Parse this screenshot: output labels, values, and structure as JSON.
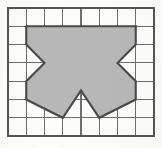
{
  "figure": {
    "background_color": "#fdfdfc"
  },
  "grid": {
    "columns": 8,
    "rows": 7,
    "origin_x": 8,
    "origin_y": 8,
    "cell_width": 18.25,
    "cell_height": 18.3,
    "line_color": "#6e6e6e",
    "border_color": "#555555",
    "line_width": 1.1,
    "border_width": 1.6
  },
  "shape": {
    "name": "shaded-polygon",
    "fill_color": "#b8b8b8",
    "stroke_color": "#4a4a4a",
    "stroke_width": 2.1,
    "fill_opacity": 1,
    "vertices_grid": [
      [
        1,
        1
      ],
      [
        7,
        1
      ],
      [
        7,
        2
      ],
      [
        6,
        3
      ],
      [
        7,
        4
      ],
      [
        7,
        5
      ],
      [
        5,
        6
      ],
      [
        4,
        4.5
      ],
      [
        3,
        6
      ],
      [
        1,
        5
      ],
      [
        1,
        4
      ],
      [
        2,
        3
      ],
      [
        1,
        2
      ]
    ],
    "vertex_count": 13,
    "symmetry": "vertical mirror about column 4"
  }
}
